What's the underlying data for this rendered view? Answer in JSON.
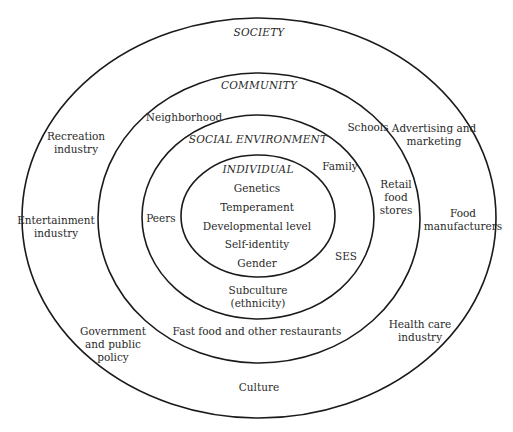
{
  "rings": [
    {
      "name": "society",
      "title": "SOCIETY",
      "cx": 259,
      "cy": 218,
      "rx": 237,
      "ry": 200
    },
    {
      "name": "community",
      "title": "COMMUNITY",
      "cx": 259,
      "cy": 218,
      "rx": 161,
      "ry": 145
    },
    {
      "name": "social-environment",
      "title": "SOCIAL ENVIRONMENT",
      "cx": 258,
      "cy": 217,
      "rx": 116,
      "ry": 102
    },
    {
      "name": "individual",
      "title": "INDIVIDUAL",
      "cx": 258,
      "cy": 216,
      "rx": 77,
      "ry": 61
    }
  ],
  "society": {
    "title": "SOCIETY",
    "items": {
      "recreation": "Recreation\nindustry",
      "entertainment": "Entertainment\nindustry",
      "government": "Government\nand public\npolicy",
      "culture": "Culture",
      "advertising": "Advertising and\nmarketing",
      "food_manufacturers": "Food\nmanufacturers",
      "health_care": "Health care\nindustry"
    }
  },
  "community": {
    "title": "COMMUNITY",
    "items": {
      "neighborhood": "Neighborhood",
      "schools": "Schools",
      "retail": "Retail\nfood\nstores",
      "fast_food": "Fast food and other restaurants"
    }
  },
  "social_environment": {
    "title": "SOCIAL ENVIRONMENT",
    "items": {
      "family": "Family",
      "peers": "Peers",
      "ses": "SES",
      "subculture": "Subculture\n(ethnicity)"
    }
  },
  "individual": {
    "title": "INDIVIDUAL",
    "items": [
      "Genetics",
      "Temperament",
      "Developmental level",
      "Self-identity",
      "Gender"
    ]
  }
}
